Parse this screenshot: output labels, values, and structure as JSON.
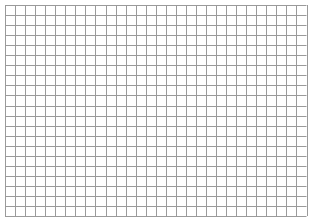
{
  "page": {
    "background_color": "#ffffff"
  },
  "grid": {
    "origin_x": 5,
    "origin_y": 5,
    "columns": 30,
    "rows": 21,
    "cell_width": 10.05,
    "cell_height": 10.05,
    "line_color": "#9a9a9a",
    "line_width": 1
  }
}
